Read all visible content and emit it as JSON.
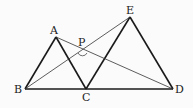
{
  "diagram": {
    "points": {
      "A": {
        "x": 56,
        "y": 37,
        "label": "A",
        "lx": 50,
        "ly": 34
      },
      "B": {
        "x": 25,
        "y": 89,
        "label": "B",
        "lx": 14,
        "ly": 93
      },
      "C": {
        "x": 86,
        "y": 89,
        "label": "C",
        "lx": 82,
        "ly": 101
      },
      "D": {
        "x": 173,
        "y": 89,
        "label": "D",
        "lx": 175,
        "ly": 93
      },
      "E": {
        "x": 130,
        "y": 17,
        "label": "E",
        "lx": 126,
        "ly": 14
      },
      "P": {
        "x": 82,
        "y": 51,
        "label": "P",
        "lx": 78,
        "ly": 46
      }
    },
    "segments": [
      [
        "A",
        "B"
      ],
      [
        "A",
        "C"
      ],
      [
        "B",
        "D"
      ],
      [
        "C",
        "E"
      ],
      [
        "E",
        "D"
      ],
      [
        "B",
        "E"
      ],
      [
        "A",
        "D"
      ]
    ],
    "angle_mark": "angle BPD at P",
    "colors": {
      "line": "#1a1a1a",
      "thin": "#333333",
      "background": "#fbfbfb"
    }
  }
}
